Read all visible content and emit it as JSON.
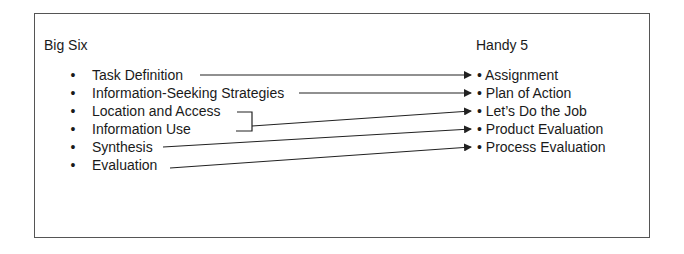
{
  "diagram": {
    "left_heading": "Big Six",
    "right_heading": "Handy 5",
    "bullet": "•",
    "big_six": [
      {
        "label": "Task Definition"
      },
      {
        "label": "Information-Seeking Strategies"
      },
      {
        "label": "Location and Access"
      },
      {
        "label": "Information Use"
      },
      {
        "label": "Synthesis"
      },
      {
        "label": "Evaluation"
      }
    ],
    "handy_5": [
      {
        "label": "Assignment"
      },
      {
        "label": "Plan of Action"
      },
      {
        "label": "Let’s Do the Job"
      },
      {
        "label": "Product Evaluation"
      },
      {
        "label": "Process Evaluation"
      }
    ],
    "mappings": [
      {
        "from": [
          "Task Definition"
        ],
        "to": "Assignment"
      },
      {
        "from": [
          "Information-Seeking Strategies"
        ],
        "to": "Plan of Action"
      },
      {
        "from": [
          "Location and Access",
          "Information Use"
        ],
        "to": "Let’s Do the Job"
      },
      {
        "from": [
          "Synthesis"
        ],
        "to": "Product Evaluation"
      },
      {
        "from": [
          "Evaluation"
        ],
        "to": "Process Evaluation"
      }
    ],
    "line_color": "#222222",
    "border_color": "#555555"
  }
}
